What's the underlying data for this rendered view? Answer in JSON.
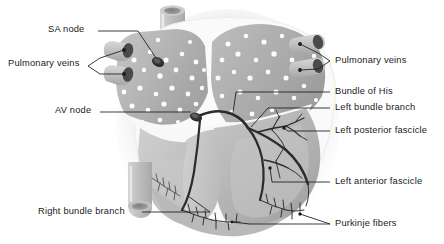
{
  "figure": {
    "background_color": "#ffffff",
    "label_text_color": "#1a1a1a",
    "leader_line_color": "#1a1a1a",
    "palette": {
      "myocardium_mid": "#b4b4b4",
      "myocardium_dark": "#9a9a9a",
      "myocardium_light": "#c9c9c9",
      "chamber_white": "#f4f4f4",
      "outer_halo": "#e8e8e8",
      "vessel_gray": "#bdbdbd",
      "vessel_lumen": "#8f8f8f",
      "node_dark": "#3a3a3a",
      "conduction_dark": "#2e2e2e",
      "speckle_white": "#fdfdfd"
    }
  },
  "labels_left": [
    {
      "id": "sa-node",
      "text": "SA node",
      "x": 48,
      "y": 28
    },
    {
      "id": "pulmonary-veins-left",
      "text": "Pulmonary veins",
      "x": 8,
      "y": 62
    },
    {
      "id": "av-node",
      "text": "AV node",
      "x": 55,
      "y": 109
    },
    {
      "id": "right-bundle-branch",
      "text": "Right bundle branch",
      "x": 38,
      "y": 214
    }
  ],
  "labels_right": [
    {
      "id": "pulmonary-veins-right",
      "text": "Pulmonary veins",
      "x": 333,
      "y": 57
    },
    {
      "id": "bundle-of-his",
      "text": "Bundle of His",
      "x": 333,
      "y": 88
    },
    {
      "id": "left-bundle-branch",
      "text": "Left bundle branch",
      "x": 333,
      "y": 104
    },
    {
      "id": "left-posterior-fascicle",
      "text": "Left posterior fascicle",
      "x": 333,
      "y": 127
    },
    {
      "id": "left-anterior-fascicle",
      "text": "Left anterior fascicle",
      "x": 333,
      "y": 178
    },
    {
      "id": "purkinje-fibers",
      "text": "Purkinje fibers",
      "x": 333,
      "y": 220
    }
  ],
  "anatomy_parts": [
    "superior vena cava",
    "inferior vena cava",
    "right atrium",
    "left atrium",
    "right ventricle",
    "left ventricle",
    "interventricular septum",
    "pulmonary veins",
    "sinoatrial node",
    "atrioventricular node",
    "bundle of His",
    "right bundle branch",
    "left bundle branch",
    "left anterior fascicle",
    "left posterior fascicle",
    "purkinje fibers"
  ]
}
